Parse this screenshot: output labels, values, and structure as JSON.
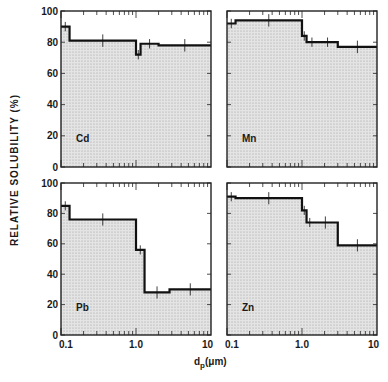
{
  "figure": {
    "ylabel": "RELATIVE SOLUBILITY (%)",
    "xlabel_main": "d",
    "xlabel_sub": "p",
    "xlabel_unit": "(μm)",
    "colors": {
      "line": "#111111",
      "fill": "#d9d9d9",
      "axis": "#222222",
      "background": "#ffffff"
    }
  },
  "chart_data": [
    {
      "type": "area",
      "title": "Cd",
      "xlabel": "dp (μm)",
      "ylabel": "RELATIVE SOLUBILITY (%)",
      "xscale": "log",
      "xlim": [
        0.1,
        10
      ],
      "ylim": [
        0,
        100
      ],
      "xticks": [
        "0.1",
        "1.0",
        "10"
      ],
      "yticks": [
        "0",
        "20",
        "40",
        "60",
        "80",
        "100"
      ],
      "steps": [
        {
          "x0": 0.1,
          "x1": 0.13,
          "y": 90
        },
        {
          "x0": 0.13,
          "x1": 1.0,
          "y": 81
        },
        {
          "x0": 1.0,
          "x1": 1.15,
          "y": 72
        },
        {
          "x0": 1.15,
          "x1": 2.0,
          "y": 79
        },
        {
          "x0": 2.0,
          "x1": 10,
          "y": 78
        }
      ]
    },
    {
      "type": "area",
      "title": "Mn",
      "xlabel": "dp (μm)",
      "ylabel": "RELATIVE SOLUBILITY (%)",
      "xscale": "log",
      "xlim": [
        0.1,
        10
      ],
      "ylim": [
        0,
        100
      ],
      "xticks": [
        "0.1",
        "1.0",
        "10"
      ],
      "yticks": [
        "0",
        "20",
        "40",
        "60",
        "80",
        "100"
      ],
      "steps": [
        {
          "x0": 0.1,
          "x1": 0.13,
          "y": 92
        },
        {
          "x0": 0.13,
          "x1": 1.0,
          "y": 94
        },
        {
          "x0": 1.0,
          "x1": 1.15,
          "y": 84
        },
        {
          "x0": 1.15,
          "x1": 1.6,
          "y": 80
        },
        {
          "x0": 1.6,
          "x1": 3.0,
          "y": 80
        },
        {
          "x0": 3.0,
          "x1": 10,
          "y": 77
        }
      ]
    },
    {
      "type": "area",
      "title": "Pb",
      "xlabel": "dp (μm)",
      "ylabel": "RELATIVE SOLUBILITY (%)",
      "xscale": "log",
      "xlim": [
        0.1,
        10
      ],
      "ylim": [
        0,
        100
      ],
      "xticks": [
        "0.1",
        "1.0",
        "10"
      ],
      "yticks": [
        "0",
        "20",
        "40",
        "60",
        "80",
        "100"
      ],
      "steps": [
        {
          "x0": 0.1,
          "x1": 0.13,
          "y": 85
        },
        {
          "x0": 0.13,
          "x1": 1.0,
          "y": 76
        },
        {
          "x0": 1.0,
          "x1": 1.3,
          "y": 56
        },
        {
          "x0": 1.3,
          "x1": 2.8,
          "y": 28
        },
        {
          "x0": 2.8,
          "x1": 10,
          "y": 30
        }
      ]
    },
    {
      "type": "area",
      "title": "Zn",
      "xlabel": "dp (μm)",
      "ylabel": "RELATIVE SOLUBILITY (%)",
      "xscale": "log",
      "xlim": [
        0.1,
        10
      ],
      "ylim": [
        0,
        100
      ],
      "xticks": [
        "0.1",
        "1.0",
        "10"
      ],
      "yticks": [
        "0",
        "20",
        "40",
        "60",
        "80",
        "100"
      ],
      "steps": [
        {
          "x0": 0.1,
          "x1": 0.13,
          "y": 91
        },
        {
          "x0": 0.13,
          "x1": 1.0,
          "y": 90
        },
        {
          "x0": 1.0,
          "x1": 1.15,
          "y": 82
        },
        {
          "x0": 1.15,
          "x1": 1.4,
          "y": 74
        },
        {
          "x0": 1.4,
          "x1": 3.0,
          "y": 74
        },
        {
          "x0": 3.0,
          "x1": 10,
          "y": 59
        }
      ]
    }
  ]
}
